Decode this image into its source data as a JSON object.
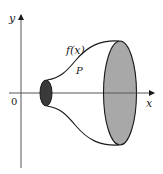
{
  "figure": {
    "type": "surface-of-revolution",
    "labels": {
      "y_axis": "y",
      "x_axis": "x",
      "origin": "0",
      "function": "f(x)",
      "point": "P"
    },
    "colors": {
      "stroke": "#1a1a1a",
      "small_disk_fill": "#3a3a3a",
      "large_disk_fill": "#a8a8a8",
      "background": "#ffffff"
    }
  }
}
